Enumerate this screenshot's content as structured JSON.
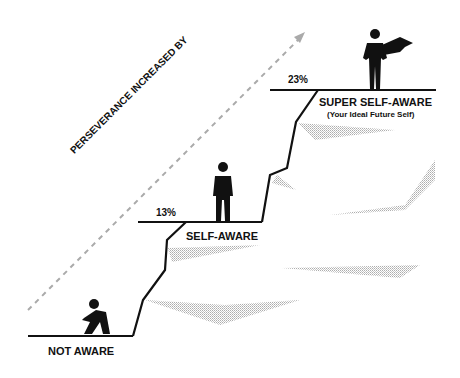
{
  "diagram": {
    "arrow_label": "PERSEVERANCE INCREASED BY",
    "steps": [
      {
        "name": "NOT AWARE",
        "percent": ""
      },
      {
        "name": "SELF-AWARE",
        "percent": "13%"
      },
      {
        "name": "SUPER SELF-AWARE",
        "subtitle": "(Your Ideal Future Self)",
        "percent": "23%"
      }
    ]
  }
}
